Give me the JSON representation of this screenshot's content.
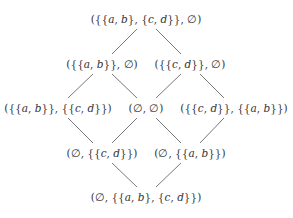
{
  "diagram": {
    "type": "hasse-lattice",
    "colors": {
      "text": "#333333",
      "edge": "#555555",
      "background": "#ffffff"
    },
    "nodes": [
      {
        "id": "top",
        "label": "({{a, b}, {c, d}}, ∅)",
        "x": 146,
        "y": 19
      },
      {
        "id": "l2a",
        "label": "({{a, b}}, ∅)",
        "x": 102,
        "y": 64
      },
      {
        "id": "l2b",
        "label": "({{c, d}}, ∅)",
        "x": 190,
        "y": 64
      },
      {
        "id": "l3a",
        "label": "({{a, b}}, {{c, d}})",
        "x": 58,
        "y": 108
      },
      {
        "id": "l3b",
        "label": "(∅, ∅)",
        "x": 146,
        "y": 108
      },
      {
        "id": "l3c",
        "label": "({{c, d}}, {{a, b}})",
        "x": 234,
        "y": 108
      },
      {
        "id": "l4a",
        "label": "(∅, {{c, d}})",
        "x": 102,
        "y": 153
      },
      {
        "id": "l4b",
        "label": "(∅, {{a, b}})",
        "x": 190,
        "y": 153
      },
      {
        "id": "bot",
        "label": "(∅, {{a, b}, {c, d}})",
        "x": 146,
        "y": 197
      }
    ],
    "edges": [
      {
        "from": "top",
        "to": "l2a",
        "x1": 137,
        "y1": 29,
        "x2": 112,
        "y2": 54
      },
      {
        "from": "top",
        "to": "l2b",
        "x1": 156,
        "y1": 29,
        "x2": 181,
        "y2": 54
      },
      {
        "from": "l2a",
        "to": "l3a",
        "x1": 93,
        "y1": 74,
        "x2": 68,
        "y2": 98
      },
      {
        "from": "l2a",
        "to": "l3b",
        "x1": 112,
        "y1": 74,
        "x2": 137,
        "y2": 98
      },
      {
        "from": "l2b",
        "to": "l3b",
        "x1": 181,
        "y1": 74,
        "x2": 156,
        "y2": 98
      },
      {
        "from": "l2b",
        "to": "l3c",
        "x1": 200,
        "y1": 74,
        "x2": 224,
        "y2": 98
      },
      {
        "from": "l3a",
        "to": "l4a",
        "x1": 68,
        "y1": 118,
        "x2": 93,
        "y2": 143
      },
      {
        "from": "l3b",
        "to": "l4a",
        "x1": 137,
        "y1": 118,
        "x2": 112,
        "y2": 143
      },
      {
        "from": "l3b",
        "to": "l4b",
        "x1": 156,
        "y1": 118,
        "x2": 181,
        "y2": 143
      },
      {
        "from": "l3c",
        "to": "l4b",
        "x1": 224,
        "y1": 118,
        "x2": 200,
        "y2": 143
      },
      {
        "from": "l4a",
        "to": "bot",
        "x1": 112,
        "y1": 163,
        "x2": 137,
        "y2": 187
      },
      {
        "from": "l4b",
        "to": "bot",
        "x1": 181,
        "y1": 163,
        "x2": 156,
        "y2": 187
      }
    ]
  }
}
